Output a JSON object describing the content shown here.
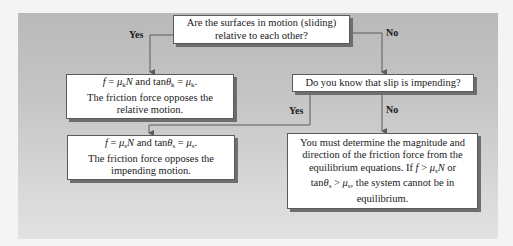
{
  "diagram": {
    "type": "flowchart",
    "colors": {
      "panel_top": "#b9b9b9",
      "panel_bottom": "#e2e2e2",
      "box_fill": "#ffffff",
      "box_shadow": "#6e6e6e",
      "connector": "#5a5a5a"
    },
    "nodes": {
      "q1": {
        "lines": [
          "Are the surfaces in motion (sliding)",
          "relative to each other?"
        ]
      },
      "kinetic": {
        "formula": "f = μkN and tanθk = μk.",
        "lines": [
          "The friction force opposes the",
          "relative motion."
        ]
      },
      "q2": {
        "lines": [
          "Do you know that slip is impending?"
        ]
      },
      "static": {
        "formula": "f = μsN and tanθs = μs.",
        "lines": [
          "The friction force opposes the",
          "impending motion."
        ]
      },
      "equilibrium": {
        "lines": [
          "You must determine the magnitude and",
          "direction of the friction force from the",
          "equilibrium equations. If f > μsN or",
          "tanθs > μs, the system cannot be in",
          "equilibrium."
        ]
      }
    },
    "edges": [
      {
        "from": "q1",
        "to": "kinetic",
        "label": "Yes"
      },
      {
        "from": "q1",
        "to": "q2",
        "label": "No"
      },
      {
        "from": "q2",
        "to": "static",
        "label": "Yes"
      },
      {
        "from": "q2",
        "to": "equilibrium",
        "label": "No"
      }
    ]
  }
}
